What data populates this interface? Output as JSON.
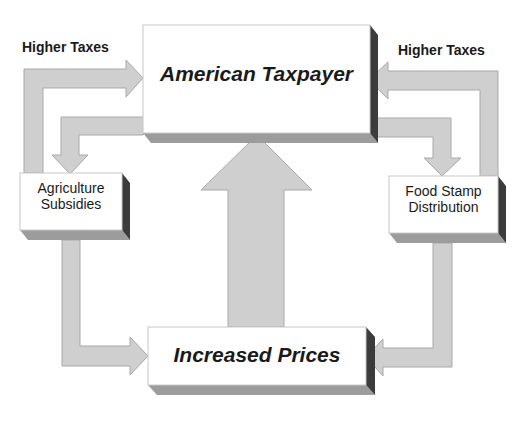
{
  "diagram": {
    "type": "flow",
    "nodes": [
      {
        "id": "taxpayer",
        "label": "American Taxpayer"
      },
      {
        "id": "agriculture",
        "label_lines": [
          "Agriculture",
          "Subsidies"
        ]
      },
      {
        "id": "foodstamp",
        "label_lines": [
          "Food Stamp",
          "Distribution"
        ]
      },
      {
        "id": "prices",
        "label": "Increased Prices"
      }
    ],
    "edge_labels": {
      "left_tax": "Higher Taxes",
      "right_tax": "Higher Taxes"
    },
    "edges": [
      {
        "from": "agriculture",
        "to": "taxpayer",
        "label": "Higher Taxes"
      },
      {
        "from": "taxpayer",
        "to": "agriculture"
      },
      {
        "from": "foodstamp",
        "to": "taxpayer",
        "label": "Higher Taxes"
      },
      {
        "from": "taxpayer",
        "to": "foodstamp"
      },
      {
        "from": "agriculture",
        "to": "prices"
      },
      {
        "from": "foodstamp",
        "to": "prices"
      },
      {
        "from": "prices",
        "to": "taxpayer"
      }
    ],
    "colors": {
      "arrow_fill": "#cfcfcf",
      "arrow_stroke": "#a8a8a8",
      "box_fill": "#ffffff",
      "box_side": "#3a3a3a",
      "box_bottom": "#9a9a9a",
      "text": "#1a1a1a"
    }
  }
}
